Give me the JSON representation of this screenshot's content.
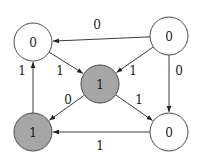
{
  "diagram": {
    "type": "directed-graph",
    "colors": {
      "background": "#ffffff",
      "node_active": "#a6a6a6",
      "node_inactive": "#ffffff",
      "stroke": "#3a3a3a"
    },
    "nodes": [
      {
        "id": "top-left",
        "label": "0",
        "x": 33,
        "y": 42,
        "r": 19,
        "filled": false
      },
      {
        "id": "top-right",
        "label": "0",
        "x": 169,
        "y": 36,
        "r": 19,
        "filled": false
      },
      {
        "id": "center",
        "label": "1",
        "x": 100,
        "y": 84,
        "r": 19,
        "filled": true
      },
      {
        "id": "bottom-left",
        "label": "1",
        "x": 33,
        "y": 132,
        "r": 19,
        "filled": true
      },
      {
        "id": "bottom-right",
        "label": "0",
        "x": 169,
        "y": 132,
        "r": 19,
        "filled": false
      }
    ],
    "edges": [
      {
        "from": "top-right",
        "to": "top-left",
        "label": "0",
        "lx": 97,
        "ly": 25
      },
      {
        "from": "top-left",
        "to": "center",
        "label": "1",
        "lx": 60,
        "ly": 71
      },
      {
        "from": "top-right",
        "to": "center",
        "label": "1",
        "lx": 133,
        "ly": 71
      },
      {
        "from": "top-right",
        "to": "bottom-right",
        "label": "0",
        "lx": 179,
        "ly": 71
      },
      {
        "from": "bottom-left",
        "to": "top-left",
        "label": "1",
        "lx": 22,
        "ly": 71
      },
      {
        "from": "center",
        "to": "bottom-left",
        "label": "0",
        "lx": 68,
        "ly": 100
      },
      {
        "from": "center",
        "to": "bottom-right",
        "label": "1",
        "lx": 139,
        "ly": 100
      },
      {
        "from": "bottom-right",
        "to": "bottom-left",
        "label": "1",
        "lx": 100,
        "ly": 146
      }
    ]
  }
}
